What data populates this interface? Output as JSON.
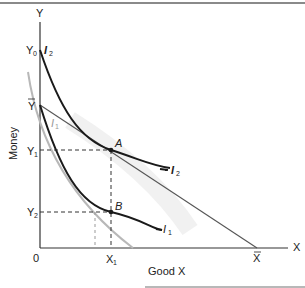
{
  "diagram": {
    "axes": {
      "y_axis_label": "Y",
      "x_axis_label": "X",
      "y_title": "Money",
      "x_title": "Good X",
      "origin_label": "0"
    },
    "tick_labels": {
      "y0": "Y",
      "y0_sub": "0",
      "ybar": "Y",
      "y1": "Y",
      "y1_sub": "1",
      "y2": "Y",
      "y2_sub": "2",
      "x1": "X",
      "x1_sub": "1",
      "xbar": "X"
    },
    "curves": {
      "i2_top_label": "I",
      "i2_top_sub": "2",
      "i2_right_label": "I",
      "i2_right_sub": "2",
      "i1_right_label": "I",
      "i1_right_sub": "1",
      "i1_faint_label": "I",
      "i1_faint_sub": "1"
    },
    "points": {
      "a_label": "A",
      "b_label": "B"
    },
    "colors": {
      "ink": "#1a1a1a",
      "gray_curve": "#b5b5b5",
      "budget_line": "#555555",
      "frame": "#8a8a8a"
    }
  }
}
